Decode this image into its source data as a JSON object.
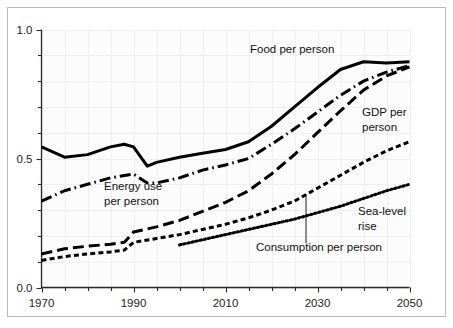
{
  "chart_data": {
    "type": "line",
    "title": "",
    "subtitle": "",
    "xlabel": "",
    "ylabel": "",
    "xlim": [
      1970,
      2050
    ],
    "ylim": [
      0.0,
      1.0
    ],
    "grid": true,
    "grid_color": "#efefef",
    "background": "#fcfcfc",
    "legend_position": "inline-annotations",
    "x_ticks": [
      1970,
      1990,
      2010,
      2030,
      2050
    ],
    "x_tick_labels": [
      "1970",
      "1990",
      "2010",
      "2030",
      "2050"
    ],
    "x_minor_tick_interval": 5,
    "y_ticks": [
      0.0,
      0.5,
      1.0
    ],
    "y_tick_labels": [
      "0.0",
      "0.5",
      "1.0"
    ],
    "y_minor_tick_interval": 0.1,
    "series": [
      {
        "name": "Food per person",
        "label": "Food per person",
        "line_style": "solid",
        "color": "#000000",
        "x": [
          1970,
          1975,
          1980,
          1985,
          1988,
          1990,
          1993,
          1995,
          2000,
          2005,
          2010,
          2015,
          2020,
          2025,
          2030,
          2035,
          2040,
          2045,
          2050
        ],
        "values": [
          0.545,
          0.505,
          0.515,
          0.545,
          0.555,
          0.545,
          0.47,
          0.485,
          0.505,
          0.52,
          0.535,
          0.565,
          0.625,
          0.7,
          0.775,
          0.845,
          0.875,
          0.87,
          0.875
        ]
      },
      {
        "name": "Energy use per person",
        "label": "Energy use\nper person",
        "line_style": "dash-dot",
        "color": "#000000",
        "x": [
          1970,
          1975,
          1980,
          1985,
          1990,
          1993,
          1995,
          2000,
          2005,
          2010,
          2015,
          2020,
          2025,
          2030,
          2035,
          2040,
          2045,
          2050
        ],
        "values": [
          0.335,
          0.375,
          0.4,
          0.425,
          0.44,
          0.405,
          0.405,
          0.425,
          0.455,
          0.475,
          0.5,
          0.555,
          0.615,
          0.68,
          0.745,
          0.8,
          0.835,
          0.86
        ]
      },
      {
        "name": "GDP per person",
        "label": "GDP per\nperson",
        "line_style": "long-dash",
        "color": "#000000",
        "x": [
          1970,
          1975,
          1980,
          1985,
          1988,
          1990,
          1995,
          2000,
          2005,
          2010,
          2015,
          2020,
          2025,
          2030,
          2035,
          2040,
          2045,
          2050
        ],
        "values": [
          0.13,
          0.15,
          0.16,
          0.168,
          0.175,
          0.215,
          0.235,
          0.26,
          0.295,
          0.33,
          0.375,
          0.44,
          0.515,
          0.6,
          0.685,
          0.765,
          0.82,
          0.855
        ]
      },
      {
        "name": "Consumption per person",
        "label": "Consumption per person",
        "line_style": "short-dash",
        "color": "#000000",
        "x": [
          1970,
          1975,
          1980,
          1985,
          1988,
          1990,
          1995,
          2000,
          2005,
          2010,
          2015,
          2020,
          2025,
          2030,
          2035,
          2040,
          2045,
          2050
        ],
        "values": [
          0.105,
          0.12,
          0.13,
          0.138,
          0.145,
          0.175,
          0.19,
          0.205,
          0.225,
          0.245,
          0.27,
          0.3,
          0.335,
          0.385,
          0.435,
          0.485,
          0.53,
          0.565
        ]
      },
      {
        "name": "Sea-level rise",
        "label": "Sea-level\nrise",
        "line_style": "dotted",
        "color": "#000000",
        "x": [
          2000,
          2005,
          2010,
          2015,
          2020,
          2025,
          2030,
          2035,
          2040,
          2045,
          2050
        ],
        "values": [
          0.165,
          0.185,
          0.205,
          0.225,
          0.245,
          0.265,
          0.29,
          0.315,
          0.345,
          0.375,
          0.4
        ]
      }
    ],
    "annotations": [
      {
        "text": "Food per person",
        "for": "Food per person"
      },
      {
        "text": "Energy use",
        "for": "Energy use per person"
      },
      {
        "text": "per person",
        "for": "Energy use per person"
      },
      {
        "text": "GDP per",
        "for": "GDP per person"
      },
      {
        "text": "person",
        "for": "GDP per person"
      },
      {
        "text": "Sea-level",
        "for": "Sea-level rise"
      },
      {
        "text": "rise",
        "for": "Sea-level rise"
      },
      {
        "text": "Consumption per person",
        "for": "Consumption per person"
      }
    ]
  },
  "axes": {
    "y": {
      "tick_labels": [
        "1.0",
        "0.5",
        "0.0"
      ]
    },
    "x": {
      "tick_labels": [
        "1970",
        "1990",
        "2010",
        "2030",
        "2050"
      ]
    }
  },
  "labels": {
    "food": "Food per person",
    "energy_line1": "Energy use",
    "energy_line2": "per person",
    "gdp_line1": "GDP per",
    "gdp_line2": "person",
    "sealevel_line1": "Sea-level",
    "sealevel_line2": "rise",
    "consumption": "Consumption per person"
  }
}
